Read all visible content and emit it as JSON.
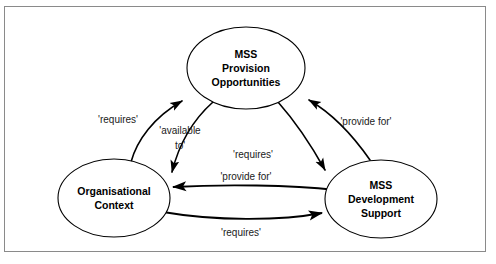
{
  "figure": {
    "type": "cycle-relationship-diagram",
    "border_color": "#8a8a8a",
    "stroke_color": "#000000",
    "background": "#ffffff"
  },
  "nodes": [
    {
      "id": "mss-provision-opportunities",
      "lines": [
        "MSS",
        "Provision",
        "Opportunities"
      ],
      "line1": "MSS",
      "line2": "Provision",
      "line3": "Opportunities",
      "cx": 246,
      "cy": 68,
      "rx": 59,
      "ry": 41
    },
    {
      "id": "organisational-context",
      "lines": [
        "Organisational",
        "Context"
      ],
      "line1": "Organisational",
      "line2": "Context",
      "cx": 114,
      "cy": 198,
      "rx": 56,
      "ry": 39
    },
    {
      "id": "mss-development-support",
      "lines": [
        "MSS",
        "Development",
        "Support"
      ],
      "line1": "MSS",
      "line2": "Development",
      "line3": "Support",
      "cx": 381,
      "cy": 199,
      "rx": 56,
      "ry": 39
    }
  ],
  "edges": [
    {
      "id": "context-to-opportunities-requires",
      "label": "'requires'",
      "from": "organisational-context",
      "to": "mss-provision-opportunities",
      "label_x": 118,
      "label_y": 120
    },
    {
      "id": "opportunities-to-context-available-to",
      "label_line1": "'available",
      "label_line2": "to'",
      "label": "'available to'",
      "from": "mss-provision-opportunities",
      "to": "organisational-context",
      "label_x": 178,
      "label_y": 133
    },
    {
      "id": "support-to-opportunities-provide-for",
      "label": "'provide for'",
      "from": "mss-development-support",
      "to": "mss-provision-opportunities",
      "label_x": 364,
      "label_y": 122
    },
    {
      "id": "opportunities-to-support-requires",
      "label": "'requires'",
      "from": "mss-provision-opportunities",
      "to": "mss-development-support",
      "label_x": 252,
      "label_y": 155
    },
    {
      "id": "support-to-context-provide-for",
      "label": "'provide for'",
      "from": "mss-development-support",
      "to": "organisational-context",
      "label_x": 245,
      "label_y": 177
    },
    {
      "id": "context-to-support-requires",
      "label": "'requires'",
      "from": "organisational-context",
      "to": "mss-development-support",
      "label_x": 241,
      "label_y": 232
    }
  ]
}
